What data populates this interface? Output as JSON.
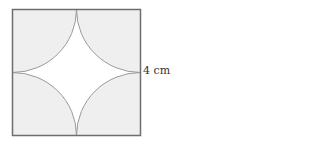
{
  "figure": {
    "side_label": "4 cm",
    "colors": {
      "shaded": "#efefef",
      "unshaded": "#ffffff",
      "border": "#6e6e6e",
      "arc": "#9a9a9a"
    }
  }
}
